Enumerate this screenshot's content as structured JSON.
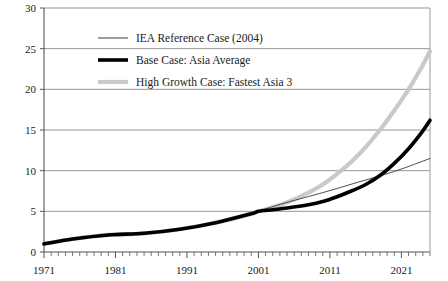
{
  "chart_data": {
    "type": "line",
    "title": "",
    "subtitle": "",
    "xlabel": "",
    "ylabel": "",
    "xlim": [
      1971,
      2025
    ],
    "ylim": [
      0,
      30
    ],
    "grid": true,
    "grid_axis": "y",
    "legend_position": "top-left-inside",
    "y_ticks": [
      "0",
      "5",
      "10",
      "15",
      "20",
      "25",
      "30"
    ],
    "y_tick_values": [
      0,
      5,
      10,
      15,
      20,
      25,
      30
    ],
    "x_ticks": [
      "1971",
      "1981",
      "1991",
      "2001",
      "2011",
      "2021"
    ],
    "x_tick_values": [
      1971,
      1981,
      1991,
      2001,
      2011,
      2021
    ],
    "x_minor_tick_interval": 1,
    "series": [
      {
        "name": "IEA Reference Case (2004)",
        "style": "thin",
        "color": "#3a3a3a",
        "width": 0.9,
        "x": [
          1971,
          1975,
          1980,
          1985,
          1990,
          1995,
          2000,
          2001,
          2002,
          2005,
          2010,
          2015,
          2020,
          2025
        ],
        "values": [
          1.0,
          1.6,
          2.1,
          2.3,
          2.8,
          3.6,
          4.7,
          5.0,
          5.3,
          6.1,
          7.3,
          8.6,
          9.9,
          11.5
        ]
      },
      {
        "name": "Base Case: Asia Average",
        "style": "thick",
        "color": "#000000",
        "width": 3.6,
        "x": [
          1971,
          1975,
          1980,
          1985,
          1990,
          1995,
          2000,
          2001,
          2003,
          2005,
          2008,
          2010,
          2012,
          2014,
          2016,
          2018,
          2020,
          2022,
          2024,
          2025
        ],
        "values": [
          1.0,
          1.6,
          2.1,
          2.3,
          2.8,
          3.6,
          4.7,
          5.0,
          5.2,
          5.4,
          5.8,
          6.2,
          6.8,
          7.5,
          8.3,
          9.4,
          10.9,
          12.7,
          14.9,
          16.2
        ]
      },
      {
        "name": "High Growth Case: Fastest Asia 3",
        "style": "thick",
        "color": "#c9c9c9",
        "width": 4.2,
        "x": [
          1971,
          1975,
          1980,
          1985,
          1990,
          1995,
          2000,
          2001,
          2003,
          2005,
          2008,
          2010,
          2012,
          2014,
          2016,
          2018,
          2020,
          2022,
          2024,
          2025
        ],
        "values": [
          1.0,
          1.6,
          2.1,
          2.3,
          2.8,
          3.6,
          4.7,
          5.0,
          5.5,
          6.1,
          7.3,
          8.3,
          9.6,
          11.1,
          12.9,
          15.0,
          17.4,
          20.0,
          23.0,
          24.7
        ]
      }
    ]
  },
  "legend": {
    "items": [
      {
        "label": "IEA Reference Case (2004)",
        "swatch": "thin-line-swatch",
        "color": "#3a3a3a"
      },
      {
        "label": "Base Case: Asia Average",
        "swatch": "thick-black-line-swatch",
        "color": "#000000"
      },
      {
        "label": "High Growth Case: Fastest Asia 3",
        "swatch": "thick-gray-line-swatch",
        "color": "#c9c9c9"
      }
    ]
  },
  "axes": {
    "y_labels": [
      "30",
      "25",
      "20",
      "15",
      "10",
      "5",
      "0"
    ],
    "x_labels": [
      "1971",
      "1981",
      "1991",
      "2001",
      "2011",
      "2021"
    ]
  },
  "colors": {
    "axis": "#555555",
    "grid": "#8a8a8a",
    "text": "#1a1a1a",
    "background": "#ffffff"
  }
}
